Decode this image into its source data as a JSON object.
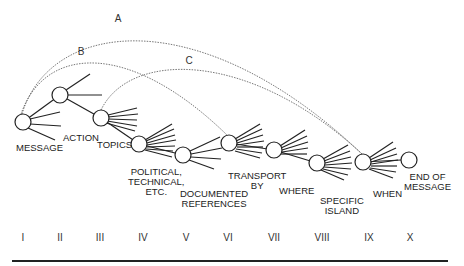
{
  "diagram": {
    "nodes": [
      {
        "label": "MESSAGE",
        "stage": "I"
      },
      {
        "label": "ACTION",
        "stage": "II"
      },
      {
        "label": "TOPICS",
        "stage": "III"
      },
      {
        "label": "POLITICAL, TECHNICAL, ETC.",
        "line1": "POLITICAL,",
        "line2": "TECHNICAL,",
        "line3": "ETC.",
        "stage": "IV"
      },
      {
        "label": "DOCUMENTED REFERENCES",
        "line1": "DOCUMENTED",
        "line2": "REFERENCES",
        "stage": "V"
      },
      {
        "label": "TRANSPORT BY",
        "line1": "TRANSPORT",
        "line2": "BY",
        "stage": "VI"
      },
      {
        "label": "WHERE",
        "stage": "VII"
      },
      {
        "label": "SPECIFIC ISLAND",
        "line1": "SPECIFIC",
        "line2": "ISLAND",
        "stage": "VIII"
      },
      {
        "label": "WHEN",
        "stage": "IX"
      },
      {
        "label": "END OF MESSAGE",
        "line1": "END OF",
        "line2": "MESSAGE",
        "stage": "X"
      }
    ],
    "curves": [
      {
        "label": "A",
        "from": "MESSAGE",
        "to": "WHEN"
      },
      {
        "label": "B",
        "from": "MESSAGE",
        "to": "TRANSPORT BY"
      },
      {
        "label": "C",
        "from": "TOPICS",
        "to": "WHEN"
      }
    ],
    "stages": [
      "I",
      "II",
      "III",
      "IV",
      "V",
      "VI",
      "VII",
      "VIII",
      "IX",
      "X"
    ]
  }
}
